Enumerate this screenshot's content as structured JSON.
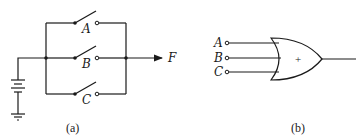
{
  "figure_a": {
    "caption": "(a)",
    "output_label": "F",
    "switches": [
      {
        "label": "A"
      },
      {
        "label": "B"
      },
      {
        "label": "C"
      }
    ],
    "description": "Parallel switch circuit with battery and ground"
  },
  "figure_b": {
    "caption": "(b)",
    "gate_symbol": "+",
    "inputs": [
      {
        "label": "A"
      },
      {
        "label": "B"
      },
      {
        "label": "C"
      }
    ],
    "description": "Three-input OR gate"
  }
}
